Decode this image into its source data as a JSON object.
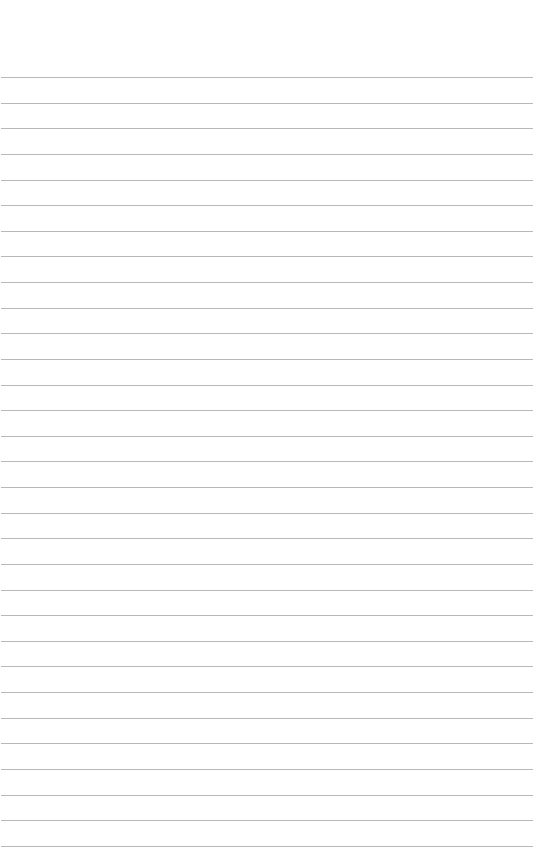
{
  "page": {
    "type": "lined-paper",
    "background_color": "#ffffff",
    "line_color": "#b8b8b8",
    "first_line_y": 77,
    "line_spacing": 25.63,
    "line_count": 31
  }
}
